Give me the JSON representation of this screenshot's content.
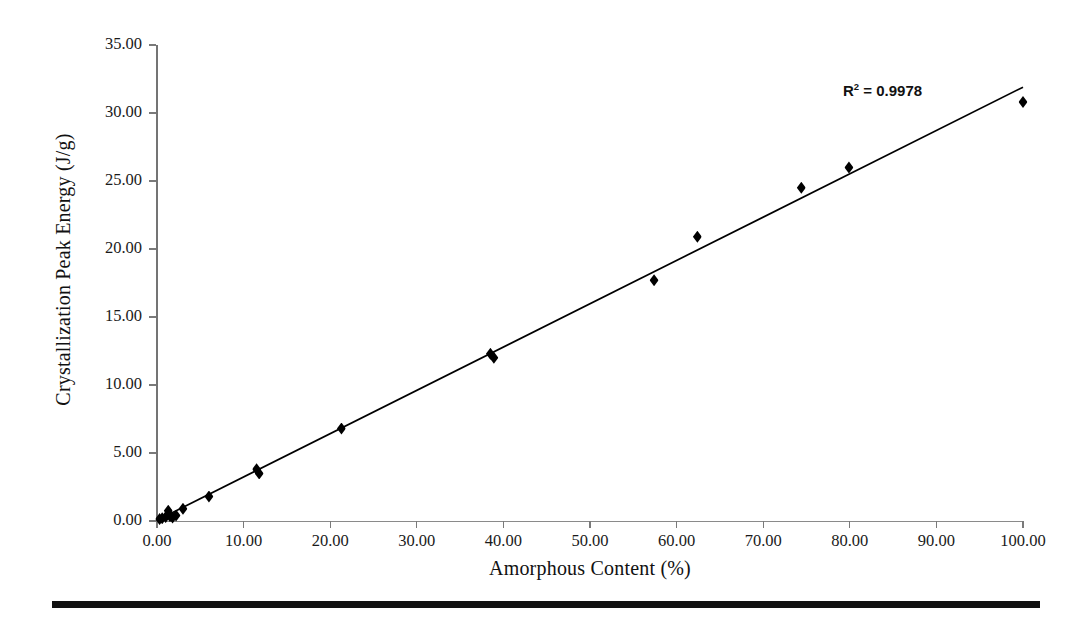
{
  "figure": {
    "background_color": "#ffffff",
    "axis_color": "#7a7a7a",
    "marker_color": "#000000",
    "trendline_color": "#000000"
  },
  "annotations": {
    "r_squared_prefix": "R",
    "r_squared_exponent": "2",
    "r_squared_value": " = 0.9978"
  },
  "chart_data": {
    "type": "scatter",
    "title": "",
    "xlabel": "Amorphous Content (%)",
    "ylabel": "Crystallization Peak Energy (J/g)",
    "xlim": [
      0,
      100
    ],
    "ylim": [
      0,
      35
    ],
    "xticks": [
      "0.00",
      "10.00",
      "20.00",
      "30.00",
      "40.00",
      "50.00",
      "60.00",
      "70.00",
      "80.00",
      "90.00",
      "100.00"
    ],
    "xtick_values": [
      0,
      10,
      20,
      30,
      40,
      50,
      60,
      70,
      80,
      90,
      100
    ],
    "yticks": [
      "0.00",
      "5.00",
      "10.00",
      "15.00",
      "20.00",
      "25.00",
      "30.00",
      "35.00"
    ],
    "ytick_values": [
      0,
      5,
      10,
      15,
      20,
      25,
      30,
      35
    ],
    "grid": false,
    "legend": false,
    "marker_shape": "diamond",
    "series": [
      {
        "name": "Crystallization peak energy vs amorphous content",
        "points": [
          [
            0.3,
            0.15
          ],
          [
            0.6,
            0.2
          ],
          [
            1.0,
            0.3
          ],
          [
            1.3,
            0.75
          ],
          [
            1.5,
            0.35
          ],
          [
            1.8,
            0.25
          ],
          [
            2.2,
            0.4
          ],
          [
            3.0,
            0.9
          ],
          [
            6.0,
            1.8
          ],
          [
            11.5,
            3.8
          ],
          [
            11.8,
            3.5
          ],
          [
            21.3,
            6.8
          ],
          [
            38.5,
            12.3
          ],
          [
            38.9,
            12.0
          ],
          [
            57.4,
            17.7
          ],
          [
            62.4,
            20.9
          ],
          [
            74.4,
            24.5
          ],
          [
            79.9,
            26.0
          ],
          [
            100.0,
            30.8
          ]
        ]
      }
    ],
    "trendline": {
      "type": "linear",
      "r_squared": 0.9978,
      "x_start": 0.0,
      "y_start": 0.05,
      "x_end": 100.0,
      "y_end": 31.9
    }
  }
}
